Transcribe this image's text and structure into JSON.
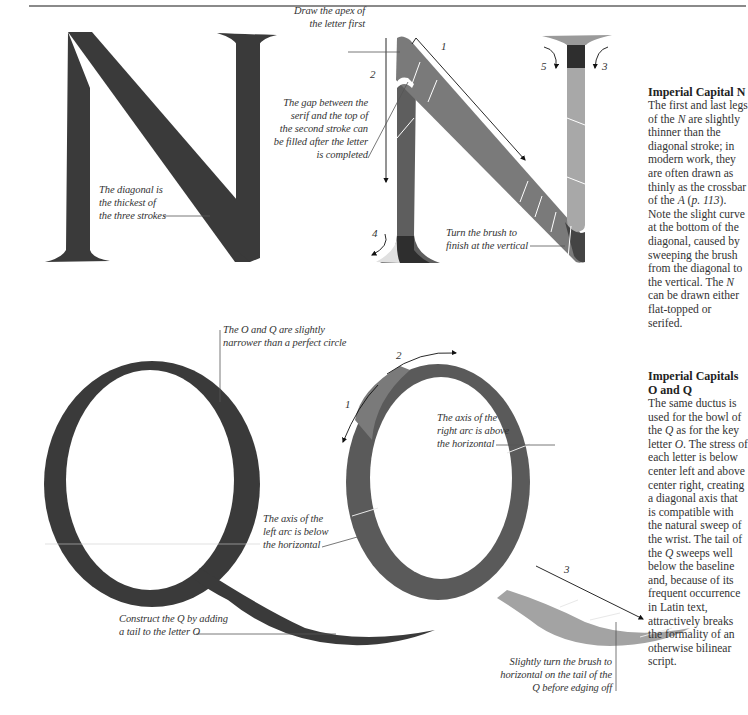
{
  "section_n": {
    "heading": "Imperial Capital N",
    "body_parts": [
      "The first and last legs of the ",
      "N",
      " are slightly thinner than the diagonal stroke; in modern work, they are often drawn as thinly as the crossbar of the ",
      "A",
      " (",
      "p. 113",
      "). Note the slight curve at the bottom of the diagonal, caused by sweeping the brush from the diagonal to the vertical. The ",
      "N",
      " can be drawn either flat-topped or serifed."
    ],
    "captions": {
      "diagonal": [
        "The diagonal is",
        "the thickest of",
        "the three strokes"
      ],
      "apex": [
        "Draw the apex of",
        "the letter first"
      ],
      "gap": [
        "The gap between the",
        "serif and the top of",
        "the second stroke can",
        "be filled after the letter",
        "is completed"
      ],
      "turn": [
        "Turn the brush to",
        "finish at the vertical"
      ]
    },
    "stroke_numbers": [
      "1",
      "2",
      "3",
      "4",
      "5"
    ]
  },
  "section_oq": {
    "heading_line1": "Imperial Capitals",
    "heading_line2": "O and Q",
    "body_parts": [
      "The same ductus is used for the bowl of the ",
      "Q",
      " as for the key letter ",
      "O",
      ". The stress of each letter is below center left and above center right, creating a diagonal axis that is compatible with the natural sweep of the wrist. The tail of the ",
      "Q",
      " sweeps well below the baseline and, because of its frequent occurrence in Latin text, attractively breaks the formality of an otherwise bilinear script."
    ],
    "captions": {
      "narrower": [
        "The O and Q are slightly",
        "narrower than a perfect circle"
      ],
      "left_axis": [
        "The axis of the",
        "left arc is below",
        "the horizontal"
      ],
      "right_axis": [
        "The axis of the",
        "right arc is above",
        "the horizontal"
      ],
      "construct": [
        "Construct the Q by adding",
        "a tail to the letter O"
      ],
      "slightly_turn": [
        "Slightly turn the brush to",
        "horizontal on the tail of the",
        "Q before edging off"
      ]
    },
    "stroke_numbers": [
      "1",
      "2",
      "3"
    ]
  },
  "colors": {
    "ink": "#3a3a3a",
    "stroke_mid": "#6f6f6f",
    "stroke_dark": "#2e2e2e",
    "stroke_light": "#a9a9a9",
    "stroke_pale": "#d8d8d8",
    "rule": "#8a8a8a"
  }
}
